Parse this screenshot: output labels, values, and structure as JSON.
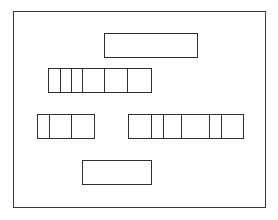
{
  "diagram": {
    "canvas": {
      "width": 278,
      "height": 220,
      "background": "#ffffff",
      "line_color": "#2e2e2e"
    },
    "frame": {
      "x": 13,
      "y": 11,
      "width": 253,
      "height": 197
    },
    "boxes": [
      {
        "id": "top-box",
        "x": 104,
        "y": 33,
        "width": 94,
        "height": 25,
        "cells": [
          94
        ]
      },
      {
        "id": "middle-segmented-box",
        "x": 48,
        "y": 68,
        "width": 104,
        "height": 25,
        "cells": [
          12,
          11,
          11,
          22,
          23,
          25
        ]
      },
      {
        "id": "lower-left-segmented-box",
        "x": 37,
        "y": 114,
        "width": 58,
        "height": 25,
        "cells": [
          12,
          22,
          24
        ]
      },
      {
        "id": "lower-right-segmented-box",
        "x": 128,
        "y": 114,
        "width": 116,
        "height": 25,
        "cells": [
          23,
          12,
          18,
          28,
          12,
          23
        ]
      },
      {
        "id": "bottom-box",
        "x": 82,
        "y": 160,
        "width": 70,
        "height": 25,
        "cells": [
          70
        ]
      }
    ]
  }
}
